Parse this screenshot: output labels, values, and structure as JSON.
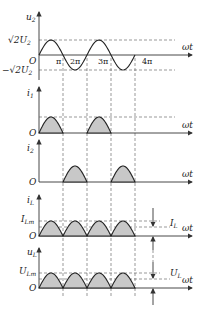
{
  "diagram": {
    "x_axis_label": "ωt",
    "origin_label": "O",
    "tick_labels": [
      "π",
      "2π",
      "3π",
      "4π"
    ],
    "panels": [
      {
        "id": "u2",
        "ylabel": "u",
        "ylabel_sub": "2",
        "pos_label": "√2U",
        "pos_sub": "2",
        "neg_label": "−√2U",
        "neg_sub": "2",
        "type": "sine"
      },
      {
        "id": "i1",
        "ylabel": "i",
        "ylabel_sub": "1",
        "type": "half-odd"
      },
      {
        "id": "i2",
        "ylabel": "i",
        "ylabel_sub": "2",
        "type": "half-even"
      },
      {
        "id": "iL",
        "ylabel": "i",
        "ylabel_sub": "L",
        "peak_label": "I",
        "peak_sub": "Lm",
        "avg_label": "I",
        "avg_sub": "L",
        "type": "full"
      },
      {
        "id": "uL",
        "ylabel": "u",
        "ylabel_sub": "L",
        "peak_label": "U",
        "peak_sub": "Lm",
        "avg_label": "U",
        "avg_sub": "L",
        "type": "full"
      }
    ]
  }
}
